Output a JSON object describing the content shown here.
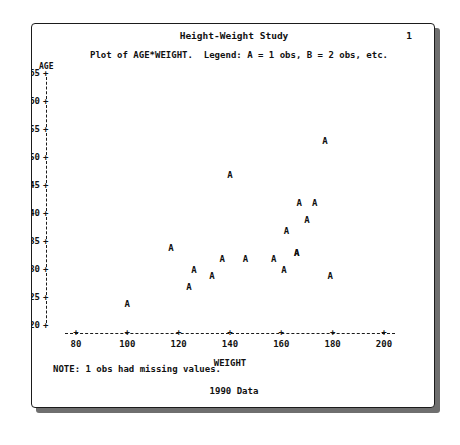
{
  "report": {
    "title": "Height-Weight Study",
    "page_number": "1",
    "subtitle": "Plot of AGE*WEIGHT.  Legend: A = 1 obs, B = 2 obs, etc.",
    "note": "NOTE: 1 obs had missing values.",
    "footer": "1990 Data",
    "ink_color": "#111111",
    "border_color": "#1b1b1b",
    "shadow_color": "#6f6f6f",
    "paper_color": "#ffffff"
  },
  "chart_data": {
    "type": "scatter",
    "title": "Height-Weight Study",
    "subtitle": "Plot of AGE*WEIGHT.  Legend: A = 1 obs, B = 2 obs, etc.",
    "xlabel": "WEIGHT",
    "ylabel": "AGE",
    "xlim": [
      80,
      200
    ],
    "ylim": [
      20,
      65
    ],
    "xticks": [
      80,
      100,
      120,
      140,
      160,
      180,
      200
    ],
    "yticks": [
      20,
      25,
      30,
      35,
      40,
      45,
      50,
      55,
      60,
      65
    ],
    "xtick_labels": [
      "80",
      "100",
      "120",
      "140",
      "160",
      "180",
      "200"
    ],
    "ytick_labels": [
      "20",
      "25",
      "30",
      "35",
      "40",
      "45",
      "50",
      "55",
      "60",
      "65"
    ],
    "tick_glyph": "+",
    "axis_style": "dashed",
    "grid": false,
    "legend": "A = 1 obs, B = 2 obs, etc.",
    "marker_label": "A",
    "point_count": 18,
    "points": [
      {
        "x": 100,
        "y": 24,
        "label": "A"
      },
      {
        "x": 117,
        "y": 34,
        "label": "A"
      },
      {
        "x": 124,
        "y": 27,
        "label": "A"
      },
      {
        "x": 126,
        "y": 30,
        "label": "A"
      },
      {
        "x": 133,
        "y": 29,
        "label": "A"
      },
      {
        "x": 137,
        "y": 32,
        "label": "A"
      },
      {
        "x": 140,
        "y": 47,
        "label": "A"
      },
      {
        "x": 146,
        "y": 32,
        "label": "A"
      },
      {
        "x": 157,
        "y": 32,
        "label": "A"
      },
      {
        "x": 161,
        "y": 30,
        "label": "A"
      },
      {
        "x": 162,
        "y": 37,
        "label": "A"
      },
      {
        "x": 166,
        "y": 33,
        "label": "A"
      },
      {
        "x": 167,
        "y": 42,
        "label": "A"
      },
      {
        "x": 170,
        "y": 39,
        "label": "A"
      },
      {
        "x": 173,
        "y": 42,
        "label": "A"
      },
      {
        "x": 177,
        "y": 53,
        "label": "A"
      },
      {
        "x": 179,
        "y": 29,
        "label": "A"
      },
      {
        "x": 166,
        "y": 33,
        "label": "A"
      }
    ],
    "annotations": [
      "NOTE: 1 obs had missing values.",
      "1990 Data"
    ]
  }
}
